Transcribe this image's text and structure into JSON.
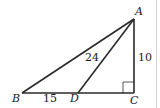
{
  "diagram": {
    "type": "geometry-triangle",
    "vertices": {
      "A": {
        "label": "A",
        "x": 134,
        "y": 19
      },
      "B": {
        "label": "B",
        "x": 22,
        "y": 93
      },
      "C": {
        "label": "C",
        "x": 134,
        "y": 93
      },
      "D": {
        "label": "D",
        "x": 78,
        "y": 93
      }
    },
    "segments": [
      {
        "from": "A",
        "to": "B"
      },
      {
        "from": "A",
        "to": "C"
      },
      {
        "from": "B",
        "to": "C"
      },
      {
        "from": "A",
        "to": "D"
      }
    ],
    "measurements": {
      "BD": "15",
      "AD": "24",
      "AC": "10"
    },
    "right_angle_at": "C",
    "colors": {
      "stroke": "#2a2a2a",
      "text": "#1a1a1a",
      "background": "#ffffff"
    }
  }
}
